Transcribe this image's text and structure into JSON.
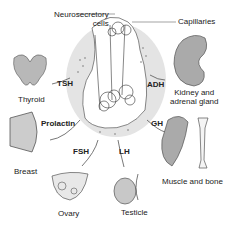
{
  "diagram": {
    "center": {
      "neurosecretory_label": "Neurosecretory cells",
      "neurosecretory_line1": "Neurosecretory",
      "neurosecretory_line2": "cells",
      "capillaries_label": "Capillaries"
    },
    "hormones": [
      {
        "name": "TSH",
        "target": "Thyroid"
      },
      {
        "name": "ADH",
        "target": "Kidney and adrenal gland"
      },
      {
        "name": "Prolactin",
        "target": "Breast"
      },
      {
        "name": "GH",
        "target": "Muscle and bone"
      },
      {
        "name": "FSH",
        "target": "Ovary"
      },
      {
        "name": "LH",
        "target": "Testicle"
      }
    ],
    "targets": {
      "thyroid": "Thyroid",
      "kidney_line1": "Kidney and",
      "kidney_line2": "adrenal gland",
      "breast": "Breast",
      "muscle": "Muscle and bone",
      "ovary": "Ovary",
      "testicle": "Testicle"
    },
    "colors": {
      "organ_fill": "#b8b8b8",
      "pituitary_halo": "#e4e4e4",
      "line": "#333333"
    }
  }
}
